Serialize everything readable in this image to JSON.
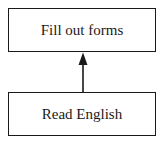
{
  "diagram": {
    "nodes": [
      {
        "id": "fill-out-forms",
        "label": "Fill out forms"
      },
      {
        "id": "read-english",
        "label": "Read English"
      }
    ],
    "edges": [
      {
        "from": "read-english",
        "to": "fill-out-forms",
        "style": "arrow"
      }
    ],
    "colors": {
      "stroke": "#1a1a1a",
      "background": "#ffffff"
    }
  }
}
